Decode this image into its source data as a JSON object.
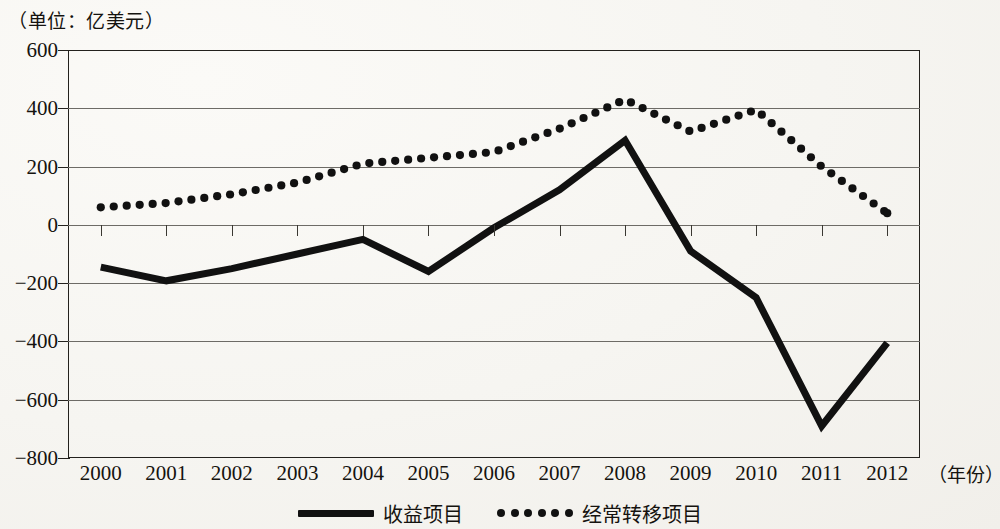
{
  "unit_caption": "（单位：亿美元）",
  "axis": {
    "x_title": "（年份）",
    "y_ticks": [
      "600",
      "400",
      "200",
      "0",
      "−200",
      "−400",
      "−600",
      "−800"
    ],
    "x_ticks": [
      "2000",
      "2001",
      "2002",
      "2003",
      "2004",
      "2005",
      "2006",
      "2007",
      "2008",
      "2009",
      "2010",
      "2011",
      "2012"
    ]
  },
  "legend": {
    "items": [
      {
        "label": "收益项目",
        "style": "solid",
        "color": "#111111"
      },
      {
        "label": "经常转移项目",
        "style": "dotted",
        "color": "#111111"
      }
    ]
  },
  "chart_data": {
    "type": "line",
    "title": "",
    "subtitle": "",
    "xlabel": "（年份）",
    "ylabel": "（单位：亿美元）",
    "unit": "亿美元",
    "grid": true,
    "legend_position": "bottom",
    "xlim": [
      2000,
      2012
    ],
    "ylim": [
      -800,
      600
    ],
    "ytick_step": 200,
    "categories": [
      "2000",
      "2001",
      "2002",
      "2003",
      "2004",
      "2005",
      "2006",
      "2007",
      "2008",
      "2009",
      "2010",
      "2011",
      "2012"
    ],
    "x": [
      2000,
      2001,
      2002,
      2003,
      2004,
      2005,
      2006,
      2007,
      2008,
      2009,
      2010,
      2011,
      2012
    ],
    "series": [
      {
        "name": "收益项目",
        "style": "solid",
        "color": "#111111",
        "values": [
          -145,
          -192,
          -150,
          -100,
          -50,
          -160,
          -10,
          120,
          290,
          -90,
          -250,
          -690,
          -405
        ]
      },
      {
        "name": "经常转移项目",
        "style": "dotted",
        "color": "#111111",
        "values": [
          60,
          75,
          105,
          145,
          210,
          230,
          250,
          330,
          430,
          320,
          395,
          200,
          40
        ]
      }
    ]
  }
}
